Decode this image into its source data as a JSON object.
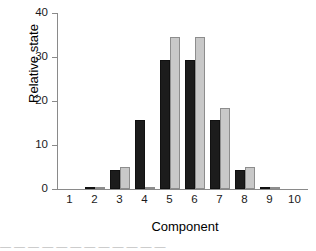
{
  "chart_data": {
    "type": "bar",
    "title": "",
    "xlabel": "Component",
    "ylabel": "Relative state",
    "categories": [
      "1",
      "2",
      "3",
      "4",
      "5",
      "6",
      "7",
      "8",
      "9",
      "10"
    ],
    "xlim": [
      0.5,
      10.5
    ],
    "ylim": [
      0,
      40
    ],
    "yticks": [
      0,
      10,
      20,
      30,
      40
    ],
    "ytick_labels": [
      "0",
      "10",
      "20",
      "30",
      "40"
    ],
    "grid": false,
    "legend": false,
    "series": [
      {
        "name": "dark",
        "color": "#1c1c1c",
        "values": [
          0,
          0.5,
          4.3,
          15.7,
          29.3,
          29.3,
          15.7,
          4.3,
          0.5,
          0
        ]
      },
      {
        "name": "light",
        "color": "#c8c8c8",
        "values": [
          0,
          0.5,
          5.0,
          0.5,
          34.5,
          34.5,
          18.4,
          5.0,
          0.5,
          0
        ]
      }
    ]
  },
  "axes": {
    "y_title": "Relative state",
    "x_title": "Component"
  },
  "artifact": {
    "bottom_strip_text": "— — — — — — — — — — — —"
  }
}
